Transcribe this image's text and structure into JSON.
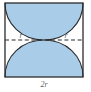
{
  "figure": {
    "type": "geometry-diagram",
    "square": {
      "side_label": "2r",
      "x": 5,
      "y": 3,
      "width": 78,
      "height": 74,
      "stroke_color": "#2b2b2b",
      "fill_color": "#ffffff"
    },
    "shaded_regions": {
      "fill_color": "#a9cde8",
      "count": 2,
      "positions": [
        "top",
        "bottom"
      ]
    },
    "arcs": {
      "count": 2,
      "radius_label": "r",
      "stroke_color": "#2b2b2b",
      "centers": [
        "left-edge-midpoint",
        "right-edge-midpoint"
      ]
    },
    "midline": {
      "style": "dashed",
      "stroke_color": "#2b2b2b",
      "y": 40
    },
    "labels": {
      "radius_left": "r",
      "radius_right": "r",
      "base": "2r"
    },
    "colors": {
      "shade": "#a9cde8",
      "ink": "#2b2b2b",
      "label": "#5a5f66",
      "background": "#ffffff"
    }
  }
}
